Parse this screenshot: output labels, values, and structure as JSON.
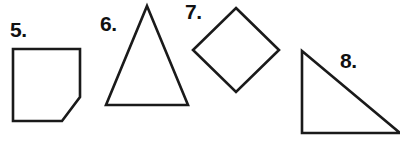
{
  "page": {
    "background_color": "#ffffff",
    "stroke_color": "#1a1a1a",
    "text_color": "#111111",
    "width": 400,
    "height": 148
  },
  "figures": [
    {
      "label": "5.",
      "shape_name": "pentagon-clipped-square",
      "description": "square with bottom-right corner cut off",
      "points": "13,49 80,49 80,97 62,121 13,121"
    },
    {
      "label": "6.",
      "shape_name": "isosceles-triangle",
      "description": "tall isosceles triangle pointing up",
      "points": "147,6 188,105 106,105"
    },
    {
      "label": "7.",
      "shape_name": "diamond-square-rotated",
      "description": "square rotated 45 degrees (diamond)",
      "points": "236,8 279,50 236,92 193,50"
    },
    {
      "label": "8.",
      "shape_name": "right-triangle",
      "description": "right triangle with right angle at lower left, hypotenuse descending to the right, clipped at right edge",
      "points": "302,51 400,133 302,133"
    }
  ]
}
